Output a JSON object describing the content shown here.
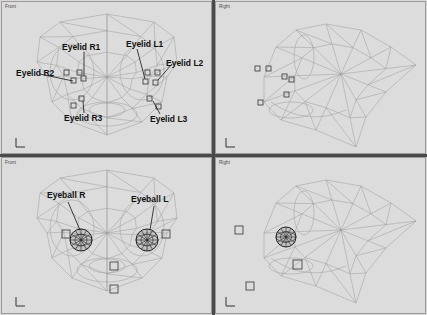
{
  "viewports": [
    {
      "id": "front-top",
      "title": "Front"
    },
    {
      "id": "right-top",
      "title": "Right"
    },
    {
      "id": "front-bottom",
      "title": "Front"
    },
    {
      "id": "right-bottom",
      "title": "Right"
    }
  ],
  "labels": {
    "eyelid_r1": "Eyelid R1",
    "eyelid_r2": "Eyelid R2",
    "eyelid_r3": "Eyelid R3",
    "eyelid_l1": "Eyelid L1",
    "eyelid_l2": "Eyelid L2",
    "eyelid_l3": "Eyelid L3",
    "eyeball_r": "Eyeball R",
    "eyeball_l": "Eyeball L"
  },
  "axis_icons": {
    "front": {
      "up": "z",
      "right": "x"
    },
    "right": {
      "up": "z",
      "right": "y"
    }
  },
  "colors": {
    "viewport_bg": "#dcdcdc",
    "wire": "#8e8e8e",
    "control_box": "#333333",
    "divider": "#4a4a4a"
  }
}
